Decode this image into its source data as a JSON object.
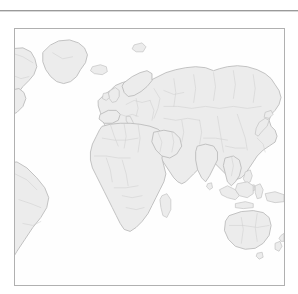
{
  "page": {
    "background_color": "#ffffff",
    "width": 298,
    "height": 294
  },
  "top_rule": {
    "name": "horizontal-rule",
    "color": "#9a9a9a",
    "visible": true
  },
  "figure": {
    "frame": {
      "border_color": "#b0b0b0",
      "background_color": "#ffffff",
      "x": 14,
      "y": 28,
      "width": 271,
      "height": 258
    },
    "caption": "",
    "title": ""
  },
  "map": {
    "type": "world-map",
    "projection": "equirectangular",
    "centering": "eurasia-centered",
    "land_fill_color": "#ececec",
    "coastline_color": "#bcbcbc",
    "country_border_color": "#cfcfcf",
    "ocean_color": "#fefefe",
    "labels_visible": false,
    "graticule_visible": false,
    "legend_visible": false,
    "regions": [
      {
        "name": "greenland",
        "label": "Greenland"
      },
      {
        "name": "north-america",
        "label": "North America"
      },
      {
        "name": "south-america",
        "label": "South America"
      },
      {
        "name": "iceland",
        "label": "Iceland"
      },
      {
        "name": "europe",
        "label": "Europe"
      },
      {
        "name": "africa",
        "label": "Africa"
      },
      {
        "name": "madagascar",
        "label": "Madagascar"
      },
      {
        "name": "asia",
        "label": "Asia"
      },
      {
        "name": "india",
        "label": "India"
      },
      {
        "name": "arabia",
        "label": "Arabian Peninsula"
      },
      {
        "name": "japan",
        "label": "Japan"
      },
      {
        "name": "indonesia",
        "label": "Indonesia"
      },
      {
        "name": "philippines",
        "label": "Philippines"
      },
      {
        "name": "australia",
        "label": "Australia"
      },
      {
        "name": "new-zealand",
        "label": "New Zealand"
      },
      {
        "name": "new-guinea",
        "label": "New Guinea"
      },
      {
        "name": "sri-lanka",
        "label": "Sri Lanka"
      },
      {
        "name": "great-britain",
        "label": "Great Britain"
      }
    ]
  }
}
